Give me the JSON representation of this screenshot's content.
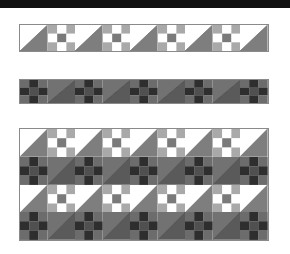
{
  "title_bar": {
    "color": "#111111"
  },
  "palette": {
    "light": {
      "tri_upper": "#ffffff",
      "tri_lower": "#7e7e7e",
      "tri_line": "#6a6a6a",
      "np_corner": "#a9a9a9",
      "np_edge": "#ffffff",
      "np_center": "#7a7a7a"
    },
    "dark": {
      "tri_upper": "#727272",
      "tri_lower": "#5a5a5a",
      "tri_line": "#3a3a3a",
      "np_corner": "#6c6c6c",
      "np_edge": "#2e2e2e",
      "np_center": "#505050"
    },
    "border": "#8a8a8a"
  },
  "strips": [
    {
      "name": "light-strip",
      "x": 19,
      "y": 24,
      "width": 250,
      "height": 28,
      "rows": [
        [
          "T:light",
          "N:light",
          "T:light",
          "N:light",
          "T:light",
          "N:light",
          "T:light",
          "N:light",
          "T:light"
        ]
      ]
    },
    {
      "name": "dark-strip",
      "x": 19,
      "y": 79,
      "width": 250,
      "height": 25,
      "rows": [
        [
          "N:dark",
          "T:dark",
          "N:dark",
          "T:dark",
          "N:dark",
          "T:dark",
          "N:dark",
          "T:dark",
          "N:dark"
        ]
      ]
    },
    {
      "name": "combined-quilt",
      "x": 19,
      "y": 128,
      "width": 250,
      "height": 113,
      "rows": [
        [
          "T:light",
          "N:light",
          "T:light",
          "N:light",
          "T:light",
          "N:light",
          "T:light",
          "N:light",
          "T:light"
        ],
        [
          "N:dark",
          "T:dark",
          "N:dark",
          "T:dark",
          "N:dark",
          "T:dark",
          "N:dark",
          "T:dark",
          "N:dark"
        ],
        [
          "T:light",
          "N:light",
          "T:light",
          "N:light",
          "T:light",
          "N:light",
          "T:light",
          "N:light",
          "T:light"
        ],
        [
          "N:dark",
          "T:dark",
          "N:dark",
          "T:dark",
          "N:dark",
          "T:dark",
          "N:dark",
          "T:dark",
          "N:dark"
        ]
      ]
    }
  ]
}
